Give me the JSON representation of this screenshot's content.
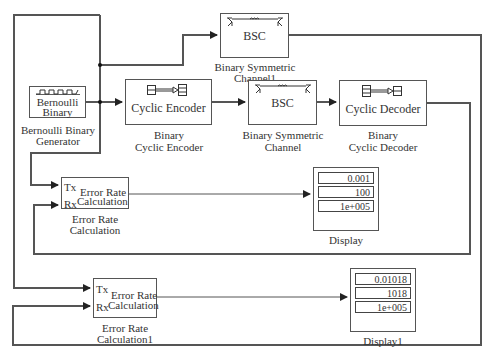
{
  "model": {
    "blocks": {
      "bernoulli": {
        "inner_label_line1": "Bernoulli",
        "inner_label_line2": "Binary",
        "caption_line1": "Bernoulli Binary",
        "caption_line2": "Generator",
        "icon": "pulse-train-icon"
      },
      "encoder": {
        "inner_label": "Cyclic Encoder",
        "caption_line1": "Binary",
        "caption_line2": "Cyclic Encoder",
        "icon": "encoder-icon"
      },
      "bsc": {
        "inner_label": "BSC",
        "caption_line1": "Binary Symmetric",
        "caption_line2": "Channel",
        "icon": "channel-icon"
      },
      "bsc1": {
        "inner_label": "BSC",
        "caption_line1": "Binary Symmetric",
        "caption_line2": "Channel1",
        "icon": "channel-icon"
      },
      "decoder": {
        "inner_label": "Cyclic Decoder",
        "caption_line1": "Binary",
        "caption_line2": "Cyclic Decoder",
        "icon": "decoder-icon"
      },
      "error_rate": {
        "port_tx": "Tx",
        "port_rx": "Rx",
        "inner_label_line1": "Error Rate",
        "inner_label_line2": "Calculation",
        "caption_line1": "Error Rate",
        "caption_line2": "Calculation"
      },
      "error_rate1": {
        "port_tx": "Tx",
        "port_rx": "Rx",
        "inner_label_line1": "Error Rate",
        "inner_label_line2": "Calculation",
        "caption_line1": "Error Rate",
        "caption_line2": "Calculation1"
      },
      "display": {
        "values": [
          "0.001",
          "100",
          "1e+005"
        ],
        "caption": "Display"
      },
      "display1": {
        "values": [
          "0.01018",
          "1018",
          "1e+005"
        ],
        "caption": "Display1"
      }
    },
    "colors": {
      "line": "#555555",
      "block_border": "#555555",
      "background": "#ffffff"
    }
  }
}
